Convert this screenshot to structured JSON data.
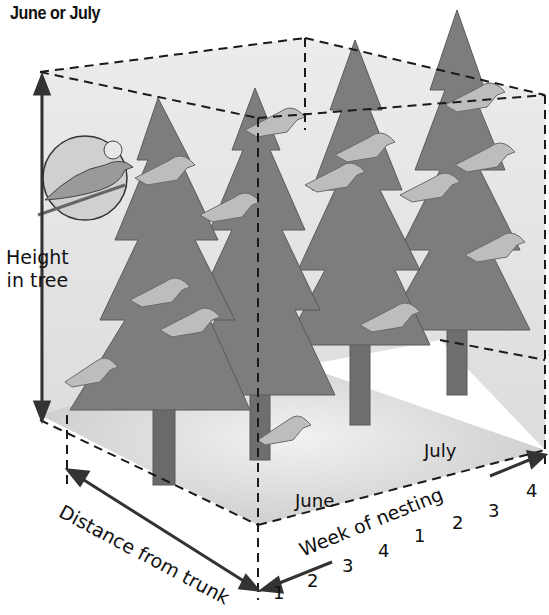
{
  "title": "June or July",
  "axes": {
    "vertical": {
      "label_line1": "Height",
      "label_line2": "in tree"
    },
    "depth": {
      "label": "Distance from trunk"
    },
    "horizontal": {
      "label": "Week of nesting",
      "months": [
        "June",
        "July"
      ],
      "ticks": [
        "1",
        "2",
        "3",
        "4",
        "1",
        "2",
        "3",
        "4"
      ]
    }
  },
  "illustration": {
    "subject": "bird nesting niche in spruce trees",
    "inset": "close-up of warbler on branch",
    "tree_count": 4,
    "colors": {
      "tree": "#7a7a7a",
      "bird": "#b5b5b5",
      "box_fill": "#e8e8e8",
      "line": "#222222"
    }
  }
}
